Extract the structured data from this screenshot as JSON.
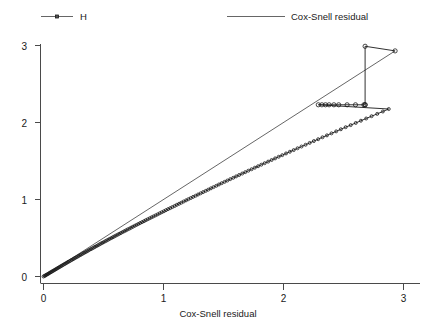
{
  "chart_data": {
    "type": "line",
    "title": "",
    "xlabel": "Cox-Snell residual",
    "ylabel": "",
    "xlim": [
      -0.03,
      3.17
    ],
    "ylim": [
      -0.08,
      3.12
    ],
    "xticks": [
      0,
      1,
      2,
      3
    ],
    "yticks": [
      0,
      1,
      2,
      3
    ],
    "xtick_labels": [
      "0",
      "1",
      "2",
      "3"
    ],
    "ytick_labels": [
      "0",
      "1",
      "2",
      "3"
    ],
    "grid": false,
    "legend_position": "top",
    "series": [
      {
        "name": "H",
        "label": "H",
        "style": "line-with-open-circle-markers",
        "color": "#1a1a1a",
        "points": [
          [
            0.0,
            0.0
          ],
          [
            0.008,
            0.008
          ],
          [
            0.015,
            0.012
          ],
          [
            0.022,
            0.02
          ],
          [
            0.03,
            0.027
          ],
          [
            0.038,
            0.033
          ],
          [
            0.046,
            0.042
          ],
          [
            0.054,
            0.05
          ],
          [
            0.062,
            0.056
          ],
          [
            0.07,
            0.065
          ],
          [
            0.079,
            0.072
          ],
          [
            0.087,
            0.08
          ],
          [
            0.096,
            0.088
          ],
          [
            0.104,
            0.096
          ],
          [
            0.113,
            0.104
          ],
          [
            0.122,
            0.112
          ],
          [
            0.131,
            0.121
          ],
          [
            0.14,
            0.129
          ],
          [
            0.149,
            0.137
          ],
          [
            0.158,
            0.146
          ],
          [
            0.167,
            0.154
          ],
          [
            0.177,
            0.163
          ],
          [
            0.186,
            0.171
          ],
          [
            0.196,
            0.18
          ],
          [
            0.205,
            0.189
          ],
          [
            0.215,
            0.197
          ],
          [
            0.225,
            0.206
          ],
          [
            0.235,
            0.215
          ],
          [
            0.245,
            0.224
          ],
          [
            0.255,
            0.233
          ],
          [
            0.265,
            0.242
          ],
          [
            0.275,
            0.251
          ],
          [
            0.286,
            0.26
          ],
          [
            0.296,
            0.27
          ],
          [
            0.307,
            0.279
          ],
          [
            0.317,
            0.288
          ],
          [
            0.328,
            0.298
          ],
          [
            0.339,
            0.307
          ],
          [
            0.35,
            0.317
          ],
          [
            0.361,
            0.326
          ],
          [
            0.372,
            0.336
          ],
          [
            0.383,
            0.346
          ],
          [
            0.395,
            0.356
          ],
          [
            0.406,
            0.365
          ],
          [
            0.418,
            0.375
          ],
          [
            0.429,
            0.385
          ],
          [
            0.441,
            0.395
          ],
          [
            0.453,
            0.405
          ],
          [
            0.465,
            0.416
          ],
          [
            0.477,
            0.426
          ],
          [
            0.489,
            0.436
          ],
          [
            0.501,
            0.446
          ],
          [
            0.514,
            0.457
          ],
          [
            0.526,
            0.467
          ],
          [
            0.539,
            0.478
          ],
          [
            0.552,
            0.489
          ],
          [
            0.565,
            0.499
          ],
          [
            0.578,
            0.51
          ],
          [
            0.591,
            0.521
          ],
          [
            0.604,
            0.532
          ],
          [
            0.618,
            0.543
          ],
          [
            0.631,
            0.554
          ],
          [
            0.645,
            0.565
          ],
          [
            0.659,
            0.577
          ],
          [
            0.673,
            0.588
          ],
          [
            0.687,
            0.599
          ],
          [
            0.701,
            0.611
          ],
          [
            0.716,
            0.622
          ],
          [
            0.73,
            0.634
          ],
          [
            0.745,
            0.646
          ],
          [
            0.76,
            0.658
          ],
          [
            0.775,
            0.67
          ],
          [
            0.79,
            0.682
          ],
          [
            0.805,
            0.694
          ],
          [
            0.821,
            0.706
          ],
          [
            0.837,
            0.718
          ],
          [
            0.852,
            0.731
          ],
          [
            0.868,
            0.743
          ],
          [
            0.885,
            0.756
          ],
          [
            0.901,
            0.769
          ],
          [
            0.917,
            0.781
          ],
          [
            0.934,
            0.794
          ],
          [
            0.951,
            0.807
          ],
          [
            0.968,
            0.821
          ],
          [
            0.985,
            0.834
          ],
          [
            1.003,
            0.847
          ],
          [
            1.02,
            0.861
          ],
          [
            1.038,
            0.875
          ],
          [
            1.056,
            0.888
          ],
          [
            1.074,
            0.902
          ],
          [
            1.093,
            0.916
          ],
          [
            1.111,
            0.931
          ],
          [
            1.13,
            0.945
          ],
          [
            1.149,
            0.959
          ],
          [
            1.168,
            0.974
          ],
          [
            1.188,
            0.989
          ],
          [
            1.207,
            1.004
          ],
          [
            1.227,
            1.019
          ],
          [
            1.247,
            1.034
          ],
          [
            1.268,
            1.049
          ],
          [
            1.288,
            1.065
          ],
          [
            1.309,
            1.08
          ],
          [
            1.33,
            1.096
          ],
          [
            1.352,
            1.112
          ],
          [
            1.373,
            1.128
          ],
          [
            1.395,
            1.145
          ],
          [
            1.417,
            1.161
          ],
          [
            1.44,
            1.178
          ],
          [
            1.462,
            1.195
          ],
          [
            1.485,
            1.212
          ],
          [
            1.509,
            1.229
          ],
          [
            1.532,
            1.246
          ],
          [
            1.556,
            1.264
          ],
          [
            1.581,
            1.282
          ],
          [
            1.605,
            1.3
          ],
          [
            1.63,
            1.318
          ],
          [
            1.656,
            1.337
          ],
          [
            1.681,
            1.355
          ],
          [
            1.707,
            1.374
          ],
          [
            1.734,
            1.393
          ],
          [
            1.761,
            1.413
          ],
          [
            1.788,
            1.432
          ],
          [
            1.815,
            1.452
          ],
          [
            1.843,
            1.472
          ],
          [
            1.872,
            1.492
          ],
          [
            1.901,
            1.513
          ],
          [
            1.93,
            1.534
          ],
          [
            1.96,
            1.555
          ],
          [
            1.99,
            1.576
          ],
          [
            2.021,
            1.598
          ],
          [
            2.053,
            1.62
          ],
          [
            2.085,
            1.642
          ],
          [
            2.117,
            1.665
          ],
          [
            2.15,
            1.688
          ],
          [
            2.184,
            1.711
          ],
          [
            2.218,
            1.735
          ],
          [
            2.253,
            1.759
          ],
          [
            2.289,
            1.783
          ],
          [
            2.325,
            1.808
          ],
          [
            2.362,
            1.833
          ],
          [
            2.4,
            1.859
          ],
          [
            2.439,
            1.885
          ],
          [
            2.478,
            1.912
          ],
          [
            2.518,
            1.939
          ],
          [
            2.56,
            1.966
          ],
          [
            2.602,
            1.994
          ],
          [
            2.645,
            2.023
          ],
          [
            2.689,
            2.052
          ],
          [
            2.734,
            2.082
          ],
          [
            2.781,
            2.112
          ],
          [
            2.828,
            2.143
          ],
          [
            2.877,
            2.175
          ]
        ],
        "plateau": {
          "value": 2.23,
          "x_start": 2.29,
          "x_end": 2.68,
          "marker_x": [
            2.29,
            2.32,
            2.35,
            2.38,
            2.42,
            2.46,
            2.53,
            2.6,
            2.67,
            2.68
          ]
        },
        "tail": [
          [
            2.68,
            2.23
          ],
          [
            2.68,
            2.99
          ],
          [
            2.93,
            2.93
          ]
        ]
      },
      {
        "name": "Cox-Snell residual",
        "label": "Cox-Snell residual",
        "style": "reference-line",
        "color": "#555555",
        "points": [
          [
            0.0,
            0.0
          ],
          [
            2.93,
            2.93
          ]
        ]
      }
    ],
    "annotations": []
  },
  "legend": {
    "entries": [
      {
        "label": "H",
        "marker": "open-circle",
        "type": "line-marker"
      },
      {
        "label": "Cox-Snell residual",
        "marker": "none",
        "type": "line"
      }
    ]
  },
  "axes": {
    "x_title": "Cox-Snell residual",
    "y_title": ""
  }
}
